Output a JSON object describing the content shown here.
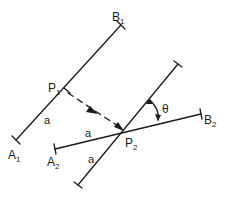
{
  "diagram": {
    "type": "geometry-construction",
    "stroke_color": "#1a1a1a",
    "background": "#ffffff",
    "segments": [
      {
        "id": "A1B1",
        "start_label": "A",
        "start_sub": "1",
        "end_label": "B",
        "end_sub": "1"
      },
      {
        "id": "A2B2",
        "start_label": "A",
        "start_sub": "2",
        "end_label": "B",
        "end_sub": "2"
      },
      {
        "id": "rotated",
        "description": "segment through P2 at angle theta to A2B2"
      }
    ],
    "points": [
      {
        "label": "P",
        "sub": "1"
      },
      {
        "label": "P",
        "sub": "2"
      }
    ],
    "length_labels": [
      "a",
      "a",
      "a"
    ],
    "angle_label": "θ",
    "arrow": {
      "from": "P1",
      "to": "P2",
      "style": "dashed"
    }
  }
}
